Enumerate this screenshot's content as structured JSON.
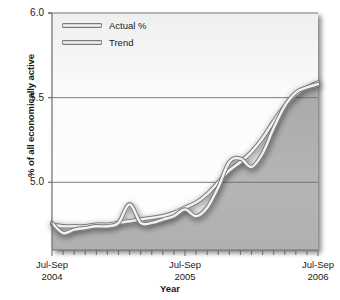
{
  "chart_data": {
    "type": "line",
    "title": "",
    "subtitle": "",
    "xlabel": "Year",
    "ylabel": "% of all economically active",
    "ylim": [
      4.6,
      6.0
    ],
    "yticks": [
      5.0,
      5.5,
      6.0
    ],
    "ytick_labels": [
      "5.0",
      "5.5",
      "6.0"
    ],
    "grid": true,
    "grid_axis": "y",
    "legend_position": "top-left",
    "x": [
      "Jul-Sep 2004",
      "Aug-Oct 2004",
      "Sep-Nov 2004",
      "Oct-Dec 2004",
      "Nov-Jan 2005",
      "Dec-Feb 2005",
      "Jan-Mar 2005",
      "Feb-Apr 2005",
      "Mar-May 2005",
      "Apr-Jun 2005",
      "May-Jul 2005",
      "Jun-Aug 2005",
      "Jul-Sep 2005",
      "Aug-Oct 2005",
      "Sep-Nov 2005",
      "Oct-Dec 2005",
      "Nov-Jan 2006",
      "Dec-Feb 2006",
      "Jan-Mar 2006",
      "Feb-Apr 2006",
      "Mar-May 2006",
      "Apr-Jun 2006",
      "May-Jul 2006",
      "Jun-Aug 2006",
      "Jul-Sep 2006"
    ],
    "xtick_labels": [
      "Jul-Sep",
      "Jul-Sep",
      "Jul-Sep"
    ],
    "xtick_sublabels": [
      "2004",
      "2005",
      "2006"
    ],
    "xtick_label_positions": [
      0,
      12,
      24
    ],
    "n_minor_ticks": 25,
    "series": [
      {
        "name": "Actual %",
        "color": "#f2f2f2",
        "outline": "#7a7a7a",
        "values": [
          4.76,
          4.7,
          4.72,
          4.73,
          4.74,
          4.74,
          4.76,
          4.87,
          4.76,
          4.76,
          4.78,
          4.8,
          4.84,
          4.8,
          4.85,
          4.97,
          5.12,
          5.14,
          5.09,
          5.17,
          5.32,
          5.45,
          5.53,
          5.56,
          5.58
        ]
      },
      {
        "name": "Trend",
        "color": "#f2f2f2",
        "outline": "#7a7a7a",
        "values": [
          4.75,
          4.74,
          4.74,
          4.74,
          4.75,
          4.75,
          4.76,
          4.77,
          4.78,
          4.79,
          4.8,
          4.82,
          4.85,
          4.88,
          4.93,
          5.0,
          5.07,
          5.12,
          5.18,
          5.26,
          5.36,
          5.45,
          5.52,
          5.56,
          5.59
        ]
      }
    ],
    "fill_color": "#b3b3b3",
    "background_upper": "#fdfdfd",
    "axis_color": "#6e6e6e",
    "gridline_color": "#6e6e6e"
  },
  "legend": {
    "items": [
      {
        "label": "Actual %"
      },
      {
        "label": "Trend"
      }
    ]
  },
  "axes": {
    "y_title": "% of all economically active",
    "x_title": "Year"
  }
}
